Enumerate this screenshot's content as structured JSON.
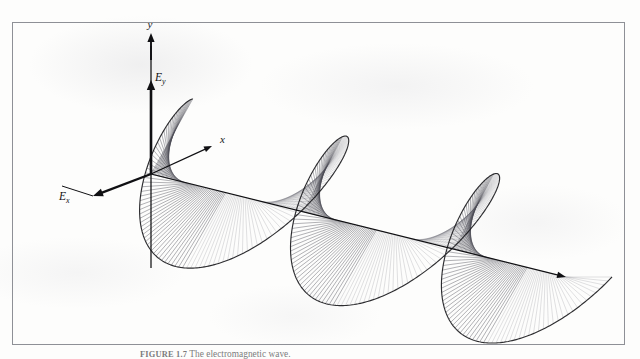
{
  "figure": {
    "type": "circularly-polarized-wave-helix",
    "background_color": "#fdfdfc",
    "frame": {
      "color": "#8e9096",
      "x": 12,
      "y": 22,
      "width": 613,
      "height": 323
    },
    "caption": {
      "number": "FIGURE 1.7",
      "text": "The electromagnetic wave.",
      "full": "FIGURE 1.7  The electromagnetic wave."
    },
    "labels": {
      "y_axis": "y",
      "x_axis": "x",
      "field_y": "E",
      "field_y_sub": "y",
      "field_x": "E",
      "field_x_sub": "x"
    },
    "colors": {
      "ink": "#17171a",
      "spoke": "#4a4a52",
      "envelope": "#1c1c20",
      "axis": "#101013"
    },
    "geometry": {
      "origin_x": 151,
      "origin_y": 174,
      "axis_end_x": 566,
      "axis_end_y": 277,
      "y_axis_top_y": 33,
      "x_axis_end_x": 212,
      "x_axis_end_y": 146,
      "ex_arrow_x": 93,
      "ex_arrow_y": 196,
      "ex_tail_x": 62,
      "ex_tail_y": 186,
      "spoke_count": 300,
      "cycles": 2.75,
      "radius_x": 46,
      "radius_y": 86,
      "tilt_dx": 10,
      "tilt_dy": -18,
      "phase_offset": 1.5708
    }
  },
  "chart_data": {
    "type": "line",
    "xlabel": "x (propagation direction)",
    "ylabel": "E field amplitude",
    "annotations": [
      "y",
      "x",
      "E_y",
      "E_x"
    ],
    "series": [
      {
        "name": "E_y",
        "form": "A*sin(kx)"
      },
      {
        "name": "E_x",
        "form": "A*cos(kx)"
      }
    ],
    "cycles": 2.75,
    "grid": false,
    "legend": "none"
  }
}
